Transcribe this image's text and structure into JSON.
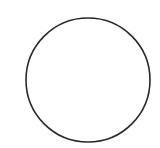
{
  "canvas": {
    "width": 160,
    "height": 148,
    "background": "#ffffff"
  },
  "shapes": [
    {
      "type": "circle",
      "cx": 88,
      "cy": 80,
      "r": 62,
      "stroke": "#2a2a2a",
      "stroke_width": 1.6,
      "fill": "none"
    }
  ]
}
